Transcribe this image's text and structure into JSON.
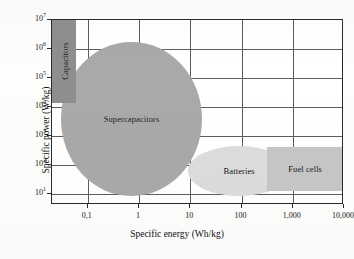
{
  "chart_data": {
    "type": "scatter",
    "title": "",
    "xlabel": "Specific energy (Wh/kg)",
    "ylabel": "Specific power (W/kg)",
    "xscale": "log",
    "yscale": "log",
    "xlim": [
      0.02,
      10000
    ],
    "ylim": [
      4,
      10000000
    ],
    "grid": true,
    "legend": "none",
    "xticks": [
      {
        "value": 0.1,
        "label": "0,1"
      },
      {
        "value": 1,
        "label": "1"
      },
      {
        "value": 10,
        "label": "10"
      },
      {
        "value": 100,
        "label": "100"
      },
      {
        "value": 1000,
        "label": "1,000"
      },
      {
        "value": 10000,
        "label": "10,000"
      }
    ],
    "yticks": [
      {
        "value": 10000000,
        "mantissa": "10",
        "exponent": "7"
      },
      {
        "value": 1000000,
        "mantissa": "10",
        "exponent": "6"
      },
      {
        "value": 100000,
        "mantissa": "10",
        "exponent": "5"
      },
      {
        "value": 10000,
        "mantissa": "10",
        "exponent": "4"
      },
      {
        "value": 1000,
        "mantissa": "10",
        "exponent": "3"
      },
      {
        "value": 100,
        "mantissa": "10",
        "exponent": "2"
      },
      {
        "value": 10,
        "mantissa": "10",
        "exponent": "1"
      }
    ],
    "regions": [
      {
        "name": "Capacitors",
        "shape": "rect",
        "color": "#8e8e8e",
        "label_orientation": "vertical",
        "x_range": [
          0.02,
          0.06
        ],
        "y_range": [
          14000,
          10000000
        ]
      },
      {
        "name": "Supercapacitors",
        "shape": "ellipse",
        "color": "#a9a9a9",
        "label_orientation": "horizontal",
        "x_range": [
          0.03,
          17
        ],
        "y_range": [
          8,
          1800000
        ]
      },
      {
        "name": "Batteries",
        "shape": "ellipse",
        "color": "#dcdcdc",
        "label_orientation": "horizontal",
        "x_range": [
          9,
          900
        ],
        "y_range": [
          8,
          450
        ]
      },
      {
        "name": "Fuel cells",
        "shape": "rect",
        "color": "#c6c6c6",
        "label_orientation": "horizontal",
        "x_range": [
          320,
          9500
        ],
        "y_range": [
          12,
          420
        ]
      }
    ]
  }
}
